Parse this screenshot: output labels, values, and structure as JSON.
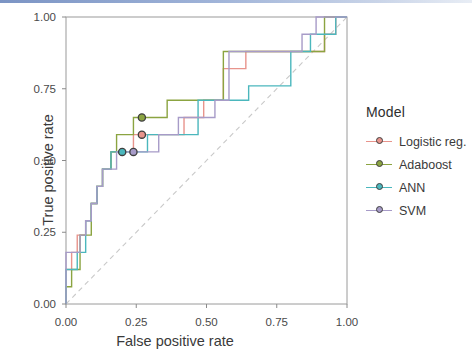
{
  "figure": {
    "background": "#ffffff",
    "top_rule_color": "#7b94c4",
    "panel_border_color": "#9a9a9a",
    "diagonal_color": "#c9c9c9"
  },
  "axes": {
    "x_title": "False positive rate",
    "y_title": "True positive rate",
    "x_ticks": [
      "0.00",
      "0.25",
      "0.50",
      "0.75",
      "1.00"
    ],
    "y_ticks": [
      "1.00",
      "0.75",
      "0.50",
      "0.25",
      "0.00"
    ],
    "xlim": [
      0,
      1
    ],
    "ylim": [
      0,
      1
    ],
    "grid": false
  },
  "legend": {
    "title": "Model",
    "position": "right",
    "items": [
      {
        "label": "Logistic reg.",
        "color": "#e8948c"
      },
      {
        "label": "Adaboost",
        "color": "#8ba441"
      },
      {
        "label": "ANN",
        "color": "#4bb7bd"
      },
      {
        "label": "SVM",
        "color": "#a79bc8"
      }
    ]
  },
  "chart_data": {
    "type": "line",
    "title": "",
    "xlabel": "False positive rate",
    "ylabel": "True positive rate",
    "xlim": [
      0,
      1
    ],
    "ylim": [
      0,
      1
    ],
    "grid": false,
    "reference_line": {
      "name": "chance",
      "x": [
        0,
        1
      ],
      "y": [
        0,
        1
      ],
      "style": "dashed",
      "color": "#c9c9c9"
    },
    "series": [
      {
        "name": "Logistic reg.",
        "color": "#e8948c",
        "marker_point": {
          "x": 0.27,
          "y": 0.59
        },
        "x": [
          0.0,
          0.0,
          0.02,
          0.02,
          0.04,
          0.04,
          0.07,
          0.07,
          0.09,
          0.09,
          0.11,
          0.11,
          0.13,
          0.13,
          0.16,
          0.16,
          0.2,
          0.2,
          0.24,
          0.24,
          0.27,
          0.27,
          0.42,
          0.42,
          0.49,
          0.49,
          0.56,
          0.56,
          0.64,
          0.64,
          0.92,
          0.92,
          0.96,
          0.96,
          1.0
        ],
        "y": [
          0.0,
          0.12,
          0.12,
          0.18,
          0.18,
          0.24,
          0.24,
          0.29,
          0.29,
          0.35,
          0.35,
          0.41,
          0.41,
          0.47,
          0.47,
          0.53,
          0.53,
          0.53,
          0.53,
          0.59,
          0.59,
          0.59,
          0.59,
          0.65,
          0.65,
          0.71,
          0.71,
          0.82,
          0.82,
          0.88,
          0.88,
          0.94,
          0.94,
          1.0,
          1.0
        ]
      },
      {
        "name": "Adaboost",
        "color": "#8ba441",
        "marker_point": {
          "x": 0.27,
          "y": 0.65
        },
        "x": [
          0.0,
          0.0,
          0.02,
          0.02,
          0.05,
          0.05,
          0.09,
          0.09,
          0.11,
          0.11,
          0.13,
          0.13,
          0.16,
          0.16,
          0.18,
          0.18,
          0.24,
          0.24,
          0.27,
          0.27,
          0.36,
          0.36,
          0.44,
          0.44,
          0.56,
          0.56,
          0.78,
          0.78,
          0.92,
          0.92,
          1.0
        ],
        "y": [
          0.0,
          0.06,
          0.06,
          0.12,
          0.12,
          0.24,
          0.24,
          0.35,
          0.35,
          0.41,
          0.41,
          0.47,
          0.47,
          0.53,
          0.53,
          0.59,
          0.59,
          0.65,
          0.65,
          0.65,
          0.65,
          0.71,
          0.71,
          0.71,
          0.71,
          0.88,
          0.88,
          0.88,
          0.88,
          1.0,
          1.0
        ]
      },
      {
        "name": "ANN",
        "color": "#4bb7bd",
        "marker_point": {
          "x": 0.2,
          "y": 0.53
        },
        "x": [
          0.0,
          0.0,
          0.04,
          0.04,
          0.07,
          0.07,
          0.09,
          0.09,
          0.11,
          0.11,
          0.13,
          0.13,
          0.16,
          0.16,
          0.2,
          0.2,
          0.29,
          0.29,
          0.36,
          0.36,
          0.47,
          0.47,
          0.56,
          0.56,
          0.65,
          0.65,
          0.8,
          0.8,
          0.87,
          0.87,
          0.96,
          0.96,
          1.0
        ],
        "y": [
          0.0,
          0.12,
          0.12,
          0.18,
          0.18,
          0.29,
          0.29,
          0.35,
          0.35,
          0.41,
          0.41,
          0.47,
          0.47,
          0.53,
          0.53,
          0.53,
          0.53,
          0.59,
          0.59,
          0.59,
          0.59,
          0.71,
          0.71,
          0.71,
          0.71,
          0.76,
          0.76,
          0.88,
          0.88,
          0.94,
          0.94,
          1.0,
          1.0
        ]
      },
      {
        "name": "SVM",
        "color": "#a79bc8",
        "marker_point": {
          "x": 0.24,
          "y": 0.53
        },
        "x": [
          0.0,
          0.0,
          0.02,
          0.02,
          0.05,
          0.05,
          0.07,
          0.07,
          0.09,
          0.09,
          0.11,
          0.11,
          0.13,
          0.13,
          0.18,
          0.18,
          0.24,
          0.24,
          0.33,
          0.33,
          0.4,
          0.4,
          0.53,
          0.53,
          0.58,
          0.58,
          0.65,
          0.65,
          0.84,
          0.84,
          0.89,
          0.89,
          1.0
        ],
        "y": [
          0.0,
          0.18,
          0.18,
          0.18,
          0.18,
          0.24,
          0.24,
          0.29,
          0.29,
          0.35,
          0.35,
          0.41,
          0.41,
          0.47,
          0.47,
          0.53,
          0.53,
          0.53,
          0.53,
          0.59,
          0.59,
          0.65,
          0.65,
          0.71,
          0.71,
          0.88,
          0.88,
          0.88,
          0.88,
          0.94,
          0.94,
          1.0,
          1.0
        ]
      }
    ]
  }
}
